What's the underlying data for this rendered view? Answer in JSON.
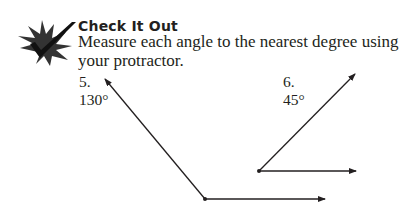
{
  "section": {
    "icon": "checkmark-starburst-icon",
    "heading": "Check It Out",
    "instruction": "Measure each angle to the nearest degree using your protractor."
  },
  "problems": [
    {
      "number": "5.",
      "answer": "130°",
      "angle_degrees": 130
    },
    {
      "number": "6.",
      "answer": "45°",
      "angle_degrees": 45
    }
  ]
}
